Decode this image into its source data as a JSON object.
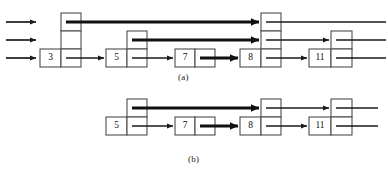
{
  "figure": {
    "type": "skip-list-diagram",
    "panels": [
      {
        "id": "a",
        "label": "(a)",
        "levels": 3,
        "entry_arrows": 3,
        "nodes": [
          {
            "key": "3",
            "height": 3,
            "x": 40,
            "cell_w": 21
          },
          {
            "key": "5",
            "height": 2,
            "x": 106,
            "cell_w": 21
          },
          {
            "key": "7",
            "height": 1,
            "x": 175,
            "cell_w": 20
          },
          {
            "key": "8",
            "height": 3,
            "x": 240,
            "cell_w": 21
          },
          {
            "key": "11",
            "height": 2,
            "x": 309,
            "cell_w": 22
          }
        ],
        "links": [
          {
            "from": "3",
            "to": "8",
            "level": 3,
            "thick": true
          },
          {
            "from": "5",
            "to": "8",
            "level": 2,
            "thick": true
          },
          {
            "from": "7",
            "to": "8",
            "level": 1,
            "thick": true
          },
          {
            "from": "3",
            "to": "5",
            "level": 1,
            "thick": false
          },
          {
            "from": "5",
            "to": "7",
            "level": 1,
            "thick": false
          },
          {
            "from": "8",
            "to": "11",
            "level": 1,
            "thick": false
          },
          {
            "from": "8",
            "to": "11",
            "level": 2,
            "thick": false
          },
          {
            "from": "8",
            "to": "edge",
            "level": 3,
            "thick": false
          },
          {
            "from": "11",
            "to": "edge",
            "level": 2,
            "thick": false
          },
          {
            "from": "11",
            "to": "edge",
            "level": 1,
            "thick": false
          }
        ]
      },
      {
        "id": "b",
        "label": "(b)",
        "levels": 2,
        "entry_arrows": 0,
        "nodes": [
          {
            "key": "5",
            "height": 2,
            "x": 106,
            "cell_w": 21
          },
          {
            "key": "7",
            "height": 1,
            "x": 175,
            "cell_w": 20
          },
          {
            "key": "8",
            "height": 2,
            "x": 240,
            "cell_w": 21
          },
          {
            "key": "11",
            "height": 2,
            "x": 309,
            "cell_w": 22
          }
        ],
        "links": [
          {
            "from": "5",
            "to": "8",
            "level": 2,
            "thick": true
          },
          {
            "from": "7",
            "to": "8",
            "level": 1,
            "thick": true
          },
          {
            "from": "5",
            "to": "7",
            "level": 1,
            "thick": false
          },
          {
            "from": "8",
            "to": "11",
            "level": 1,
            "thick": false
          },
          {
            "from": "8",
            "to": "11",
            "level": 2,
            "thick": false
          },
          {
            "from": "11",
            "to": "edge",
            "level": 2,
            "thick": false
          },
          {
            "from": "11",
            "to": "edge",
            "level": 1,
            "thick": false
          }
        ]
      }
    ],
    "node_keys_a": [
      "3",
      "5",
      "7",
      "8",
      "11"
    ],
    "node_keys_b": [
      "5",
      "7",
      "8",
      "11"
    ]
  },
  "colors": {
    "stroke": "#1a1a1a",
    "box_border": "#4d4d4d",
    "background": "#ffffff",
    "text": "#111111"
  },
  "values": {
    "a": {
      "n1": "3",
      "n2": "5",
      "n3": "7",
      "n4": "8",
      "n5": "11"
    },
    "b": {
      "n1": "5",
      "n2": "7",
      "n3": "8",
      "n4": "11"
    }
  },
  "labels": {
    "panel_a": "(a)",
    "panel_b": "(b)"
  }
}
